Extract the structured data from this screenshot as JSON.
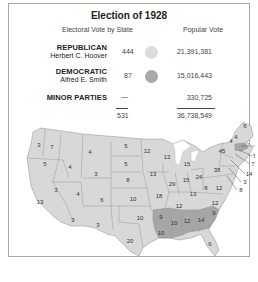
{
  "title": "Election of 1928",
  "headers": {
    "electoral": "Electoral Vote by State",
    "popular": "Popular Vote"
  },
  "parties": [
    {
      "name": "REPUBLICAN",
      "candidate": "Herbert C. Hoover",
      "electoral_votes": "444",
      "popular_vote": "21,391,381",
      "color": "#dcdcdc"
    },
    {
      "name": "DEMOCRATIC",
      "candidate": "Alfred E. Smith",
      "electoral_votes": "87",
      "popular_vote": "15,016,443",
      "color": "#a9a9a9"
    },
    {
      "name": "MINOR PARTIES",
      "candidate": "",
      "electoral_votes": "—",
      "popular_vote": "330,725",
      "color": ""
    }
  ],
  "totals": {
    "electoral_votes": "531",
    "popular_vote": "36,738,549"
  },
  "map": {
    "republican_color": "#d8d8d8",
    "democratic_color": "#a6a6a6",
    "state_labels": [
      {
        "v": "3",
        "x": 16,
        "y": 23
      },
      {
        "v": "7",
        "x": 29,
        "y": 25
      },
      {
        "v": "5",
        "x": 22,
        "y": 42
      },
      {
        "v": "4",
        "x": 47,
        "y": 45
      },
      {
        "v": "4",
        "x": 67,
        "y": 30
      },
      {
        "v": "3",
        "x": 73,
        "y": 52
      },
      {
        "v": "3",
        "x": 33,
        "y": 68
      },
      {
        "v": "4",
        "x": 55,
        "y": 72
      },
      {
        "v": "6",
        "x": 79,
        "y": 78
      },
      {
        "v": "13",
        "x": 17,
        "y": 80
      },
      {
        "v": "3",
        "x": 50,
        "y": 98
      },
      {
        "v": "3",
        "x": 75,
        "y": 103
      },
      {
        "v": "5",
        "x": 103,
        "y": 24
      },
      {
        "v": "5",
        "x": 103,
        "y": 42
      },
      {
        "v": "8",
        "x": 105,
        "y": 58
      },
      {
        "v": "10",
        "x": 110,
        "y": 77
      },
      {
        "v": "10",
        "x": 117,
        "y": 96
      },
      {
        "v": "20",
        "x": 107,
        "y": 119
      },
      {
        "v": "12",
        "x": 124,
        "y": 29
      },
      {
        "v": "13",
        "x": 144,
        "y": 35
      },
      {
        "v": "13",
        "x": 130,
        "y": 52
      },
      {
        "v": "18",
        "x": 136,
        "y": 74
      },
      {
        "v": "29",
        "x": 149,
        "y": 62
      },
      {
        "v": "15",
        "x": 164,
        "y": 42
      },
      {
        "v": "15",
        "x": 163,
        "y": 58
      },
      {
        "v": "24",
        "x": 176,
        "y": 55
      },
      {
        "v": "13",
        "x": 170,
        "y": 72
      },
      {
        "v": "12",
        "x": 156,
        "y": 84
      },
      {
        "v": "12",
        "x": 192,
        "y": 81
      },
      {
        "v": "9",
        "x": 138,
        "y": 95
      },
      {
        "v": "10",
        "x": 138,
        "y": 111
      },
      {
        "v": "10",
        "x": 151,
        "y": 101
      },
      {
        "v": "12",
        "x": 164,
        "y": 99
      },
      {
        "v": "14",
        "x": 178,
        "y": 98
      },
      {
        "v": "9",
        "x": 191,
        "y": 91
      },
      {
        "v": "6",
        "x": 187,
        "y": 122
      },
      {
        "v": "8",
        "x": 183,
        "y": 66
      },
      {
        "v": "12",
        "x": 196,
        "y": 66
      },
      {
        "v": "38",
        "x": 194,
        "y": 48
      },
      {
        "v": "45",
        "x": 199,
        "y": 29
      },
      {
        "v": "4",
        "x": 213,
        "y": 15
      },
      {
        "v": "6",
        "x": 222,
        "y": 4
      },
      {
        "v": "4",
        "x": 208,
        "y": 19
      },
      {
        "v": "18",
        "x": 236,
        "y": 24
      },
      {
        "v": "5",
        "x": 232,
        "y": 34
      },
      {
        "v": "7",
        "x": 230,
        "y": 42
      },
      {
        "v": "14",
        "x": 226,
        "y": 52
      },
      {
        "v": "3",
        "x": 222,
        "y": 60
      },
      {
        "v": "8",
        "x": 218,
        "y": 68
      }
    ]
  }
}
